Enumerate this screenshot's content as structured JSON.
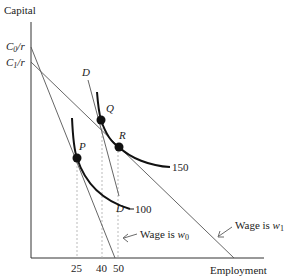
{
  "diagram": {
    "y_axis_label": "Capital",
    "x_axis_label": "Employment",
    "intercepts": [
      {
        "id": "c0",
        "label_main": "C",
        "label_sub": "0",
        "label_tail": "/r"
      },
      {
        "id": "c1",
        "label_main": "C",
        "label_sub": "1",
        "label_tail": "/r"
      }
    ],
    "x_ticks": [
      "25",
      "40",
      "50"
    ],
    "points": [
      {
        "id": "P",
        "label": "P"
      },
      {
        "id": "Q",
        "label": "Q"
      },
      {
        "id": "R",
        "label": "R"
      }
    ],
    "isoquants": [
      {
        "id": "iso100",
        "label": "100"
      },
      {
        "id": "iso150",
        "label": "150"
      }
    ],
    "parallel_line": {
      "label_top": "D",
      "label_bottom": "D"
    },
    "isocost_lines": [
      {
        "id": "w0",
        "text": "Wage is ",
        "wage_main": "w",
        "wage_sub": "0"
      },
      {
        "id": "w1",
        "text": "Wage is ",
        "wage_main": "w",
        "wage_sub": "1"
      }
    ],
    "colors": {
      "axis": "#333333",
      "isoquant": "#111111",
      "isocost": "#555555",
      "guide": "#aaaaaa"
    }
  }
}
